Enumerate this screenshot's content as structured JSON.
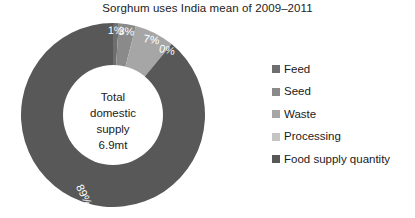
{
  "chart_data": {
    "type": "pie",
    "variant": "donut",
    "title": "Sorghum uses India mean of 2009–2011",
    "xlabel": "",
    "ylabel": "",
    "legend_position": "right",
    "grid": false,
    "categories": [
      "Feed",
      "Seed",
      "Waste",
      "Processing",
      "Food supply quantity"
    ],
    "values": [
      1,
      3,
      7,
      0,
      89
    ],
    "value_unit": "%",
    "data_labels": [
      "1%",
      "3%",
      "7%",
      "0%",
      "89%"
    ],
    "colors": [
      "#6e6e6e",
      "#8a8a8a",
      "#a6a6a6",
      "#c4c4c4",
      "#585858"
    ],
    "start_angle_deg": 0,
    "direction": "clockwise",
    "center_text": {
      "line1": "Total",
      "line2": "domestic",
      "line3": "supply",
      "line4": "6.9mt"
    }
  },
  "legend": {
    "items": [
      {
        "label": "Feed",
        "color": "#6e6e6e"
      },
      {
        "label": "Seed",
        "color": "#8a8a8a"
      },
      {
        "label": "Waste",
        "color": "#a6a6a6"
      },
      {
        "label": "Processing",
        "color": "#c4c4c4"
      },
      {
        "label": "Food supply quantity",
        "color": "#585858"
      }
    ]
  }
}
